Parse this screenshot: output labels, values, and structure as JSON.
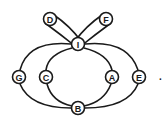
{
  "diagram": {
    "type": "graph",
    "nodes": [
      {
        "id": "D",
        "label": "D",
        "x": 50,
        "y": 19
      },
      {
        "id": "F",
        "label": "F",
        "x": 106,
        "y": 19
      },
      {
        "id": "I",
        "label": "I",
        "x": 78,
        "y": 44
      },
      {
        "id": "G",
        "label": "G",
        "x": 19,
        "y": 77
      },
      {
        "id": "C",
        "label": "C",
        "x": 46,
        "y": 77
      },
      {
        "id": "A",
        "label": "A",
        "x": 112,
        "y": 77
      },
      {
        "id": "E",
        "label": "E",
        "x": 139,
        "y": 77
      },
      {
        "id": "B",
        "label": "B",
        "x": 78,
        "y": 108
      }
    ],
    "edges": [
      [
        "D",
        "I"
      ],
      [
        "D",
        "I"
      ],
      [
        "F",
        "I"
      ],
      [
        "F",
        "I"
      ],
      [
        "I",
        "G"
      ],
      [
        "G",
        "B"
      ],
      [
        "I",
        "C"
      ],
      [
        "C",
        "B"
      ],
      [
        "I",
        "A"
      ],
      [
        "A",
        "B"
      ],
      [
        "I",
        "E"
      ],
      [
        "E",
        "B"
      ]
    ],
    "trailing_mark": "."
  }
}
